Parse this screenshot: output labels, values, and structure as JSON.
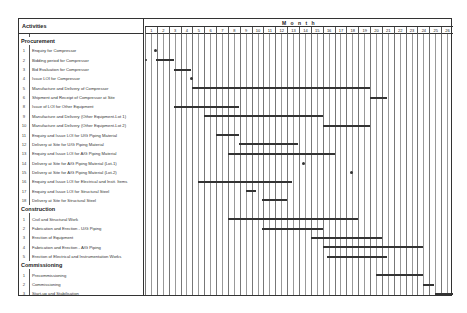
{
  "chart_data": {
    "type": "gantt",
    "title": "",
    "header": {
      "activities_label": "Activities",
      "timeline_label": "M o n t h"
    },
    "months": [
      "1",
      "2",
      "3",
      "4",
      "5",
      "6",
      "7",
      "8",
      "9",
      "10",
      "11",
      "12",
      "13",
      "14",
      "15",
      "16",
      "17",
      "18",
      "19",
      "20",
      "21",
      "22",
      "23",
      "24",
      "25",
      "26"
    ],
    "sections": [
      {
        "name": "Procurement",
        "tasks": [
          {
            "no": "1",
            "label": "Enquiry for Compressor",
            "milestone": 0.85
          },
          {
            "no": "2",
            "label": "Bidding period for Compressor",
            "start": 0.95,
            "end": 2.45
          },
          {
            "no": "3",
            "label": "Bid Evaluation for Compressor",
            "start": 2.45,
            "end": 3.9
          },
          {
            "no": "4",
            "label": "Issue LOI for Compressor",
            "milestone": 3.9
          },
          {
            "no": "5",
            "label": "Manufacture and Delivery of Compressor",
            "start": 4.0,
            "end": 19.0
          },
          {
            "no": "6",
            "label": "Shipment and Receipt of Compressor at Site",
            "start": 19.0,
            "end": 20.4
          },
          {
            "no": "8",
            "label": "Issue of LOI for Other Equipment",
            "start": 2.45,
            "end": 7.9
          },
          {
            "no": "9",
            "label": "Manufacture and Delivery (Other Equipment-Lot 1)",
            "start": 5.0,
            "end": 15.0
          },
          {
            "no": "10",
            "label": "Manufacture and Delivery (Other Equipment-Lot 2)",
            "start": 15.0,
            "end": 19.0
          },
          {
            "no": "11",
            "label": "Enquiry and Issue LOI for U/G Piping Material",
            "start": 6.0,
            "end": 7.9
          },
          {
            "no": "12",
            "label": "Delivery at Site for U/G Piping Material",
            "start": 7.9,
            "end": 12.9
          },
          {
            "no": "13",
            "label": "Enquiry and Issue LOI for A/G Piping Material",
            "start": 7.0,
            "end": 16.0
          },
          {
            "no": "14",
            "label": "Delivery at Site for A/G Piping Material (Lot-1)",
            "milestone": 13.4
          },
          {
            "no": "15",
            "label": "Delivery at Site for A/G Piping Material (Lot-2)",
            "milestone": 17.4
          },
          {
            "no": "16",
            "label": "Enquiry and Issue LOI for Electrical and Instt. Items",
            "start": 4.5,
            "end": 12.4
          },
          {
            "no": "17",
            "label": "Enquiry and Issue LOI for Structural Steel",
            "start": 8.5,
            "end": 9.4
          },
          {
            "no": "18",
            "label": "Delivery at Site for Structural Steel",
            "start": 9.9,
            "end": 12.0
          }
        ]
      },
      {
        "name": "Construction",
        "tasks": [
          {
            "no": "1",
            "label": "Civil and Structural Work",
            "start": 7.0,
            "end": 18.0
          },
          {
            "no": "2",
            "label": "Fabrication and Erection - U/G Piping",
            "start": 9.9,
            "end": 15.0
          },
          {
            "no": "3",
            "label": "Erection of Equipment",
            "start": 14.0,
            "end": 20.0
          },
          {
            "no": "4",
            "label": "Fabrication and Erection - A/G Piping",
            "start": 15.0,
            "end": 23.5
          },
          {
            "no": "5",
            "label": "Erection of Electrical and Instrumentation Works",
            "start": 15.4,
            "end": 20.4
          }
        ]
      },
      {
        "name": "Commissioning",
        "tasks": [
          {
            "no": "1",
            "label": "Precommissioning",
            "start": 19.5,
            "end": 23.5
          },
          {
            "no": "2",
            "label": "Commissioning",
            "start": 23.5,
            "end": 24.4
          },
          {
            "no": "3",
            "label": "Start-up and Stabilisation",
            "start": 24.5,
            "end": 26.0
          }
        ]
      }
    ],
    "extra_marker": {
      "row": "2",
      "x": 0.1,
      "note": "small dot left of grid"
    },
    "colors": {
      "bar": "#333333",
      "grid": "#777777",
      "border": "#333333"
    }
  }
}
